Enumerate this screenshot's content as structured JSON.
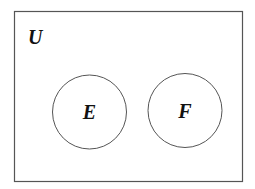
{
  "diagram": {
    "type": "venn",
    "universe": {
      "label": "U",
      "rect": {
        "x": 14,
        "y": 11,
        "width": 228,
        "height": 170
      },
      "stroke": "#555555"
    },
    "sets": [
      {
        "label": "E",
        "cx": 89.5,
        "cy": 112,
        "r": 37,
        "stroke": "#555555"
      },
      {
        "label": "F",
        "cx": 185,
        "cy": 110.5,
        "r": 37,
        "stroke": "#555555"
      }
    ],
    "relationship": "disjoint"
  }
}
